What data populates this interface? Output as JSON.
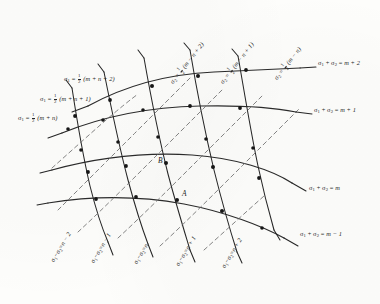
{
  "figure": {
    "background_color": "#fdfdfb",
    "ink_color": "#262626",
    "dashed_color": "#6b6b6b"
  },
  "right_labels": [
    {
      "id": "sum-m-plus-2",
      "lhs1": "σ",
      "sub1": "1",
      "plus": "+",
      "lhs2": "σ",
      "sub2": "2",
      "eq": "=",
      "rhs": "m + 2"
    },
    {
      "id": "sum-m-plus-1",
      "lhs1": "σ",
      "sub1": "1",
      "plus": "+",
      "lhs2": "σ",
      "sub2": "2",
      "eq": "=",
      "rhs": "m + 1"
    },
    {
      "id": "sum-m",
      "lhs1": "σ",
      "sub1": "1",
      "plus": "+",
      "lhs2": "σ",
      "sub2": "2",
      "eq": "=",
      "rhs": "m"
    },
    {
      "id": "sum-m-minus-1",
      "lhs1": "σ",
      "sub1": "1",
      "plus": "+",
      "lhs2": "σ",
      "sub2": "2",
      "eq": "=",
      "rhs": "m − 1"
    }
  ],
  "left_labels": [
    {
      "id": "sigma1-mn2",
      "sym": "σ",
      "sub": "1",
      "eq": "=",
      "num": "1",
      "den": "2",
      "arg": "(m + n + 2)"
    },
    {
      "id": "sigma1-mn1",
      "sym": "σ",
      "sub": "1",
      "eq": "=",
      "num": "1",
      "den": "2",
      "arg": "(m + n + 1)"
    },
    {
      "id": "sigma1-mn",
      "sym": "σ",
      "sub": "1",
      "eq": "=",
      "num": "1",
      "den": "2",
      "arg": "(m + n)"
    }
  ],
  "top_labels": [
    {
      "id": "sigma2-mn2",
      "sym": "σ",
      "sub": "2",
      "eq": "=",
      "num": "1",
      "den": "2",
      "arg": "(m − n + 2)"
    },
    {
      "id": "sigma2-mn1",
      "sym": "σ",
      "sub": "2",
      "eq": "=",
      "num": "1",
      "den": "2",
      "arg": "(m − n + 1)"
    },
    {
      "id": "sigma2-mn",
      "sym": "σ",
      "sub": "2",
      "eq": "=",
      "num": "1",
      "den": "2",
      "arg": "(m − n)"
    }
  ],
  "bottom_labels": [
    {
      "id": "diff-n-minus-2",
      "lhs1": "σ",
      "sub1": "1",
      "minus": "−",
      "lhs2": "σ",
      "sub2": "2",
      "eq": "=",
      "rhs": "n − 2"
    },
    {
      "id": "diff-n-minus-1",
      "lhs1": "σ",
      "sub1": "1",
      "minus": "−",
      "lhs2": "σ",
      "sub2": "2",
      "eq": "=",
      "rhs": "n − 1"
    },
    {
      "id": "diff-n",
      "lhs1": "σ",
      "sub1": "1",
      "minus": "−",
      "lhs2": "σ",
      "sub2": "2",
      "eq": "=",
      "rhs": "n"
    },
    {
      "id": "diff-n-plus-1",
      "lhs1": "σ",
      "sub1": "1",
      "minus": "−",
      "lhs2": "σ",
      "sub2": "2",
      "eq": "=",
      "rhs": "n + 1"
    },
    {
      "id": "diff-n-plus-2",
      "lhs1": "σ",
      "sub1": "1",
      "minus": "−",
      "lhs2": "σ",
      "sub2": "2",
      "eq": "=",
      "rhs": "n + 2"
    }
  ],
  "points": [
    {
      "id": "point-A",
      "label": "A"
    },
    {
      "id": "point-B",
      "label": "B"
    }
  ]
}
